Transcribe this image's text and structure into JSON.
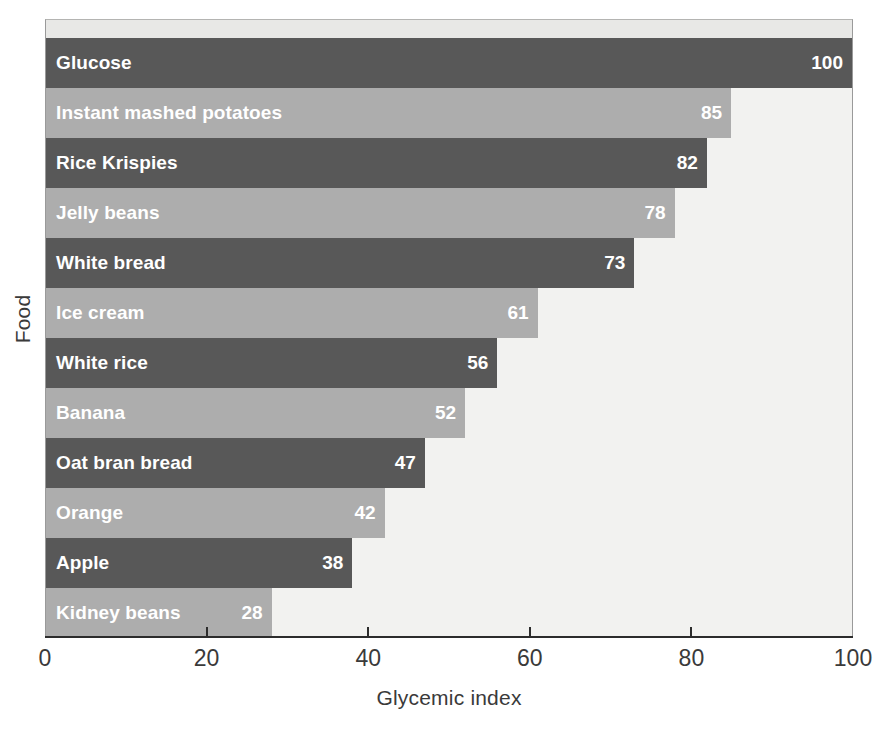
{
  "chart_data": {
    "type": "bar",
    "orientation": "horizontal",
    "title": "",
    "xlabel": "Glycemic index",
    "ylabel": "Food",
    "xlim": [
      0,
      100
    ],
    "xticks": [
      0,
      20,
      40,
      60,
      80,
      100
    ],
    "xtick_labels": [
      "0",
      "20",
      "40",
      "60",
      "80",
      "100"
    ],
    "grid": false,
    "legend": null,
    "categories": [
      "Glucose",
      "Instant mashed potatoes",
      "Rice Krispies",
      "Jelly beans",
      "White bread",
      "Ice cream",
      "White rice",
      "Banana",
      "Oat bran bread",
      "Orange",
      "Apple",
      "Kidney beans"
    ],
    "values": [
      100,
      85,
      82,
      78,
      73,
      61,
      56,
      52,
      47,
      42,
      38,
      28
    ],
    "bars": [
      {
        "label": "Glucose",
        "value": 100,
        "value_text": "100",
        "shade": "dark"
      },
      {
        "label": "Instant mashed potatoes",
        "value": 85,
        "value_text": "85",
        "shade": "light"
      },
      {
        "label": "Rice Krispies",
        "value": 82,
        "value_text": "82",
        "shade": "dark"
      },
      {
        "label": "Jelly beans",
        "value": 78,
        "value_text": "78",
        "shade": "light"
      },
      {
        "label": "White bread",
        "value": 73,
        "value_text": "73",
        "shade": "dark"
      },
      {
        "label": "Ice cream",
        "value": 61,
        "value_text": "61",
        "shade": "light"
      },
      {
        "label": "White rice",
        "value": 56,
        "value_text": "56",
        "shade": "dark"
      },
      {
        "label": "Banana",
        "value": 52,
        "value_text": "52",
        "shade": "light"
      },
      {
        "label": "Oat bran bread",
        "value": 47,
        "value_text": "47",
        "shade": "dark"
      },
      {
        "label": "Orange",
        "value": 42,
        "value_text": "42",
        "shade": "light"
      },
      {
        "label": "Apple",
        "value": 38,
        "value_text": "38",
        "shade": "dark"
      },
      {
        "label": "Kidney beans",
        "value": 28,
        "value_text": "28",
        "shade": "light"
      }
    ],
    "colors": {
      "bar_dark": "#585858",
      "bar_light": "#adadad",
      "plot_background": "#f2f2f0",
      "plot_border": "#9a9a9a",
      "axis": "#2c2c2c",
      "bar_text": "#ffffff",
      "axis_text": "#3a3a3a",
      "figure_background": "#ffffff"
    }
  }
}
